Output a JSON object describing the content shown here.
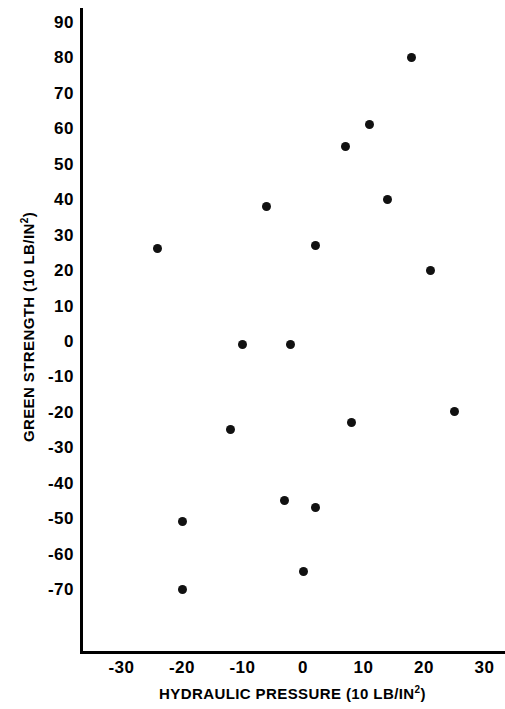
{
  "chart_data": {
    "type": "scatter",
    "title": "",
    "xlabel": "HYDRAULIC PRESSURE (10 LB/IN2)",
    "ylabel": "GREEN STRENGTH (10 LB/IN2)",
    "xlabel_base": "HYDRAULIC PRESSURE (10 LB/IN",
    "xlabel_sup": "2",
    "xlabel_tail": ")",
    "ylabel_base": "GREEN STRENGTH (10 LB/IN",
    "ylabel_sup": "2",
    "ylabel_tail": ")",
    "xlim": [
      -30,
      30
    ],
    "ylim": [
      -70,
      100
    ],
    "xticks": [
      -30,
      -20,
      -10,
      0,
      10,
      20,
      30
    ],
    "xtick_labels": [
      "-30",
      "-20",
      "-10",
      "0",
      "10",
      "20",
      "30"
    ],
    "yticks": [
      -70,
      -60,
      -50,
      -40,
      -30,
      -20,
      -10,
      0,
      10,
      20,
      30,
      40,
      50,
      60,
      70,
      80,
      90,
      100
    ],
    "ytick_labels": [
      "-70",
      "-60",
      "-50",
      "-40",
      "-30",
      "-20",
      "-10",
      "0",
      "10",
      "20",
      "30",
      "40",
      "50",
      "60",
      "70",
      "80",
      "90",
      "100"
    ],
    "grid": false,
    "legend": false,
    "marker_color": "#111111",
    "axis_color": "#000000",
    "background_color": "#ffffff",
    "points": [
      {
        "x": 17,
        "y": 104
      },
      {
        "x": 18,
        "y": 80
      },
      {
        "x": 11,
        "y": 61
      },
      {
        "x": 7,
        "y": 55
      },
      {
        "x": 14,
        "y": 40
      },
      {
        "x": -6,
        "y": 38
      },
      {
        "x": 2,
        "y": 27
      },
      {
        "x": -24,
        "y": 26
      },
      {
        "x": 21,
        "y": 20
      },
      {
        "x": -10,
        "y": -1
      },
      {
        "x": -2,
        "y": -1
      },
      {
        "x": -12,
        "y": -25
      },
      {
        "x": 25,
        "y": -20
      },
      {
        "x": 8,
        "y": -23
      },
      {
        "x": -3,
        "y": -45
      },
      {
        "x": 2,
        "y": -47
      },
      {
        "x": -20,
        "y": -51
      },
      {
        "x": 0,
        "y": -65
      },
      {
        "x": -20,
        "y": -70
      }
    ]
  }
}
